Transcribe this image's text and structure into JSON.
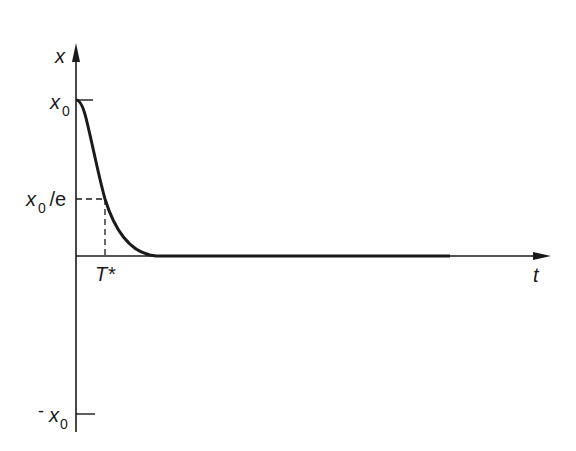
{
  "diagram": {
    "type": "decay-curve",
    "axes": {
      "y_label": "x",
      "x_label": "t"
    },
    "ticks": {
      "x0": {
        "base": "x",
        "sub": "0",
        "suffix": ""
      },
      "x0_over_e": {
        "base": "x",
        "sub": "0",
        "suffix": " /e"
      },
      "neg_x0": {
        "prefix": "-",
        "base": "x",
        "sub": "0"
      }
    },
    "markers": {
      "t_star": "T*"
    },
    "colors": {
      "ink": "#1a1a1a",
      "background": "#ffffff"
    }
  }
}
